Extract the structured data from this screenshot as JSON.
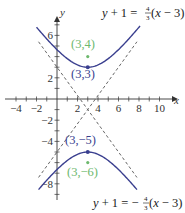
{
  "chart_data": {
    "type": "line",
    "title": "",
    "xlabel": "x",
    "ylabel": "y",
    "xlim": [
      -5,
      11
    ],
    "ylim": [
      -9,
      7
    ],
    "x_ticks": [
      "-4",
      "-2",
      "2",
      "4",
      "6",
      "8",
      "10"
    ],
    "y_ticks": [
      "6",
      "2",
      "-2",
      "-4",
      "-8"
    ],
    "grid": false,
    "series": [
      {
        "name": "hyperbola-upper-branch",
        "equation": "(y+1)^2/16 - (x-3)^2/9 = 1",
        "branch": "upper",
        "color": "#3a3f8f"
      },
      {
        "name": "hyperbola-lower-branch",
        "equation": "(y+1)^2/16 - (x-3)^2/9 = 1",
        "branch": "lower",
        "color": "#3a3f8f"
      },
      {
        "name": "asymptote-positive",
        "equation": "y+1 = 4/3(x-3)",
        "style": "dashed",
        "color": "#555555"
      },
      {
        "name": "asymptote-negative",
        "equation": "y+1 = -4/3(x-3)",
        "style": "dashed",
        "color": "#555555"
      }
    ],
    "points": [
      {
        "label": "(3,3)",
        "x": 3,
        "y": 3,
        "kind": "vertex",
        "color": "#3a3f8f"
      },
      {
        "label": "(3,−5)",
        "x": 3,
        "y": -5,
        "kind": "vertex",
        "color": "#3a3f8f"
      },
      {
        "label": "(3,4)",
        "x": 3,
        "y": 4,
        "kind": "focus",
        "color": "#6db86d"
      },
      {
        "label": "(3,−6)",
        "x": 3,
        "y": -6,
        "kind": "focus",
        "color": "#6db86d"
      }
    ],
    "annotations": [
      {
        "text": "y+1 = 4/3(x−3)",
        "position": "top-right"
      },
      {
        "text": "y+1 = −4/3(x−3)",
        "position": "bottom-right"
      }
    ]
  },
  "labels": {
    "x_axis": "x",
    "y_axis": "y",
    "x_ticks": [
      {
        "text": "−4",
        "v": -4
      },
      {
        "text": "−2",
        "v": -2
      },
      {
        "text": "2",
        "v": 2
      },
      {
        "text": "4",
        "v": 4
      },
      {
        "text": "6",
        "v": 6
      },
      {
        "text": "8",
        "v": 8
      },
      {
        "text": "10",
        "v": 10
      }
    ],
    "y_ticks": [
      {
        "text": "6",
        "v": 6
      },
      {
        "text": "2",
        "v": 2
      },
      {
        "text": "−2",
        "v": -2
      },
      {
        "text": "−4",
        "v": -4
      },
      {
        "text": "−8",
        "v": -8
      }
    ],
    "vertex_top": "(3,3)",
    "vertex_bottom": "(3,−5)",
    "focus_top": "(3,4)",
    "focus_bottom": "(3,−6)",
    "eq_top": {
      "lhs": "y",
      "mid": " + 1 = ",
      "frac_num": "4",
      "frac_den": "3",
      "open": "(",
      "var": "x",
      "rest": " − 3)"
    },
    "eq_bottom": {
      "lhs": "y",
      "mid": " + 1 = −",
      "frac_num": "4",
      "frac_den": "3",
      "open": "(",
      "var": "x",
      "rest": " − 3)"
    }
  },
  "colors": {
    "curve": "#3a3f8f",
    "focus": "#6db86d",
    "asymptote": "#555555",
    "axis": "#333333"
  }
}
